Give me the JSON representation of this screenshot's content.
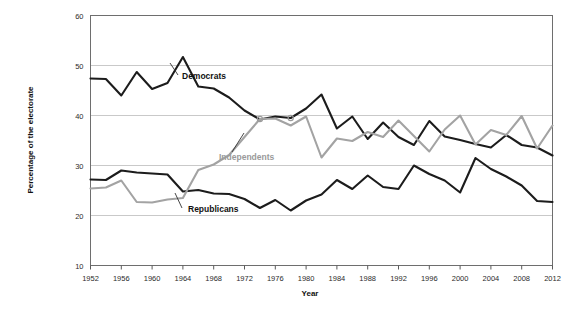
{
  "chart_data": {
    "type": "line",
    "title": "",
    "xlabel": "Year",
    "ylabel": "Percentage of the electorate",
    "xlim": [
      1952,
      2012
    ],
    "ylim": [
      10,
      60
    ],
    "yticks": [
      10,
      20,
      30,
      40,
      50,
      60
    ],
    "xticks": [
      1952,
      1956,
      1960,
      1964,
      1968,
      1972,
      1976,
      1980,
      1984,
      1988,
      1992,
      1996,
      2000,
      2004,
      2008,
      2012
    ],
    "grid": true,
    "legend_position": "inline-annotations",
    "x": [
      1952,
      1954,
      1956,
      1958,
      1960,
      1962,
      1964,
      1966,
      1968,
      1970,
      1972,
      1974,
      1976,
      1978,
      1980,
      1982,
      1984,
      1986,
      1988,
      1990,
      1992,
      1994,
      1996,
      1998,
      2000,
      2002,
      2004,
      2006,
      2008,
      2010,
      2012
    ],
    "series": [
      {
        "name": "Democrats",
        "color": "#1c1c1c",
        "values": [
          47.4,
          47.3,
          44.0,
          48.7,
          45.3,
          46.5,
          51.7,
          45.8,
          45.4,
          43.6,
          41.0,
          39.2,
          39.8,
          39.5,
          41.4,
          44.2,
          37.4,
          39.8,
          35.3,
          38.6,
          35.7,
          34.1,
          38.9,
          35.8,
          35.1,
          34.3,
          33.6,
          36.1,
          34.1,
          33.6,
          32.0
        ]
      },
      {
        "name": "Republicans",
        "color": "#1c1c1c",
        "values": [
          27.2,
          27.1,
          29.0,
          28.6,
          28.4,
          28.2,
          24.8,
          25.1,
          24.4,
          24.3,
          23.3,
          21.5,
          23.1,
          21.0,
          23.0,
          24.2,
          27.1,
          25.3,
          28.0,
          25.7,
          25.3,
          30.0,
          28.3,
          27.0,
          24.6,
          31.5,
          29.3,
          27.8,
          26.0,
          22.9,
          22.7
        ]
      },
      {
        "name": "Independents",
        "color": "#a3a3a3",
        "values": [
          25.4,
          25.6,
          27.0,
          22.7,
          22.6,
          23.2,
          23.5,
          29.1,
          30.2,
          32.1,
          35.7,
          39.3,
          39.4,
          38.0,
          39.8,
          31.6,
          35.4,
          34.9,
          36.7,
          35.7,
          39.0,
          35.9,
          32.8,
          37.2,
          40.0,
          34.2,
          37.1,
          36.1,
          39.9,
          33.4,
          38.0
        ]
      }
    ],
    "annotations": [
      {
        "text": "Democrats",
        "series": "Democrats"
      },
      {
        "text": "Republicans",
        "series": "Republicans"
      },
      {
        "text": "Independents",
        "series": "Independents"
      }
    ],
    "crossing_markers": [
      {
        "year": 1974,
        "value": 39.3
      },
      {
        "year": 1978,
        "value": 39.5
      }
    ]
  }
}
